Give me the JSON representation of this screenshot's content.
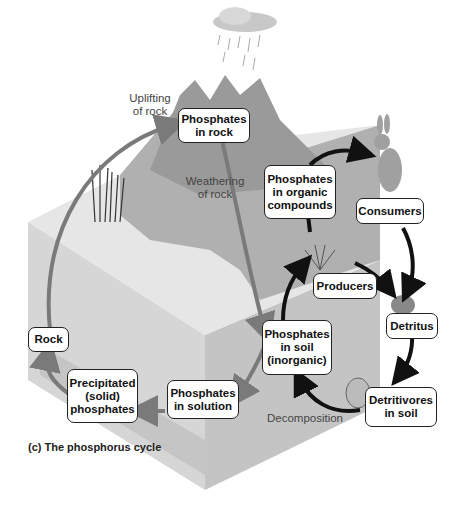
{
  "figure": {
    "caption": "(c) The phosphorus cycle",
    "title": "The phosphorus cycle"
  },
  "labels": {
    "phosphates_in_rock": "Phosphates\nin rock",
    "phosphates_in_organic_compounds": "Phosphates\nin organic\ncompounds",
    "consumers": "Consumers",
    "producers": "Producers",
    "detritus": "Detritus",
    "phosphates_in_soil": "Phosphates\nin soil\n(inorganic)",
    "detritivores_in_soil": "Detritivores\nin soil",
    "phosphates_in_solution": "Phosphates\nin solution",
    "precipitated_phosphates": "Precipitated\n(solid)\nphosphates",
    "rock": "Rock"
  },
  "process_labels": {
    "uplifting": "Uplifting\nof rock",
    "weathering": "Weathering\nof rock",
    "decomposition": "Decomposition"
  },
  "colors": {
    "ground_top": "#b4b4b4",
    "block_left": "#cfcfcf",
    "block_right": "#bdbdbd",
    "mountain": "#9a9a9a",
    "geologic_arrow": "#7a7a7a",
    "biologic_arrow": "#111111",
    "box_border": "#222222"
  }
}
